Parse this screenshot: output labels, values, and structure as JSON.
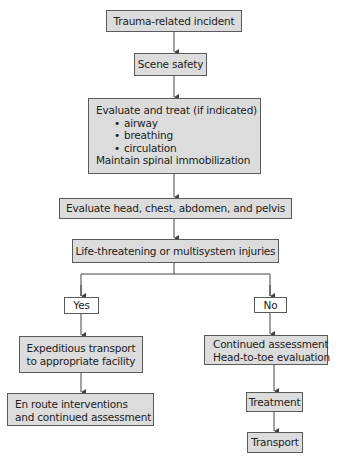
{
  "diagram": {
    "type": "flowchart",
    "colors": {
      "box_fill": "#dcdcdc",
      "decision_fill": "#ffffff",
      "border": "#5a5a5a",
      "line": "#444444",
      "text": "#222222"
    },
    "nodes": {
      "incident": {
        "label": "Trauma-related incident"
      },
      "scene": {
        "label": "Scene safety"
      },
      "evaluate": {
        "title": "Evaluate and treat (if indicated)",
        "bullets": [
          "airway",
          "breathing",
          "circulation"
        ],
        "footer": "Maintain spinal immobilization"
      },
      "head": {
        "label": "Evaluate head, chest, abdomen, and pelvis"
      },
      "life": {
        "label": "Life-threatening or multisystem injuries"
      },
      "yes": {
        "label": "Yes"
      },
      "no": {
        "label": "No"
      },
      "expeditious": {
        "lines": [
          "Expeditious transport",
          "to appropriate facility"
        ]
      },
      "enroute": {
        "lines": [
          "En route interventions",
          "and continued assessment"
        ]
      },
      "continued": {
        "lines": [
          "Continued assessment",
          "Head-to-toe evaluation"
        ]
      },
      "treatment": {
        "label": "Treatment"
      },
      "transport": {
        "label": "Transport"
      }
    },
    "edges": [
      [
        "incident",
        "scene"
      ],
      [
        "scene",
        "evaluate"
      ],
      [
        "evaluate",
        "head"
      ],
      [
        "head",
        "life"
      ],
      [
        "life",
        "yes"
      ],
      [
        "life",
        "no"
      ],
      [
        "yes",
        "expeditious"
      ],
      [
        "expeditious",
        "enroute"
      ],
      [
        "no",
        "continued"
      ],
      [
        "continued",
        "treatment"
      ],
      [
        "treatment",
        "transport"
      ]
    ]
  }
}
